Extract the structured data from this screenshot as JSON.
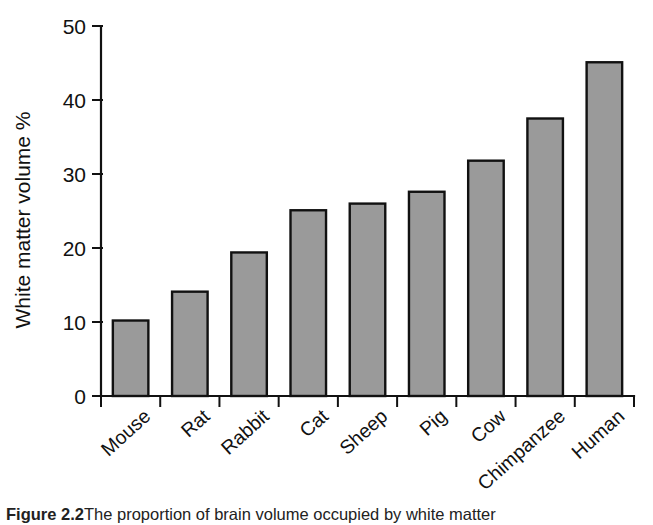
{
  "figure": {
    "caption_number": "Figure 2.2",
    "caption_text": "The proportion of brain volume occupied by white matter"
  },
  "chart_data": {
    "type": "bar",
    "title": "",
    "xlabel": "",
    "ylabel": "White matter volume %",
    "ylim": [
      0,
      50
    ],
    "yticks": [
      0,
      10,
      20,
      30,
      40,
      50
    ],
    "ytick_labels": [
      "0",
      "10",
      "20",
      "30",
      "40",
      "50"
    ],
    "grid": false,
    "legend": "none",
    "bar_color": "#9a9a9a",
    "bar_edge_color": "#111111",
    "axis_color": "#111111",
    "categories": [
      "Mouse",
      "Rat",
      "Rabbit",
      "Cat",
      "Sheep",
      "Pig",
      "Cow",
      "Chimpanzee",
      "Human"
    ],
    "values": [
      10.2,
      14.1,
      19.4,
      25.1,
      26.0,
      27.6,
      31.8,
      37.5,
      45.1
    ]
  }
}
